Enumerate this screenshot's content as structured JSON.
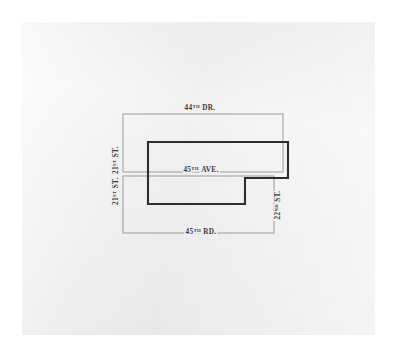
{
  "page": {
    "background_color": "#ffffff",
    "paper_color": "#f0f0f0"
  },
  "map": {
    "title": "Street block and parcel outline diagram",
    "colors": {
      "thin_block_stroke": "#9a9a9a",
      "parcel_outline_stroke": "#2e2e2e",
      "label_text": "#3a3a3a",
      "paper": "#f0f0f0"
    },
    "streets": {
      "top": {
        "name": "44",
        "ordinal": "TH",
        "type": "DR.",
        "full": "44TH DR.",
        "orientation": "horizontal"
      },
      "middle": {
        "name": "45",
        "ordinal": "TH",
        "type": "AVE.",
        "full": "45TH AVE.",
        "orientation": "horizontal"
      },
      "bottom": {
        "name": "45",
        "ordinal": "TH",
        "type": "RD.",
        "full": "45TH RD.",
        "orientation": "horizontal"
      },
      "left_upper": {
        "name": "21",
        "ordinal": "ST",
        "type": "ST.",
        "full": "21ST ST.",
        "orientation": "vertical"
      },
      "left_lower": {
        "name": "21",
        "ordinal": "ST",
        "type": "ST.",
        "full": "21ST ST.",
        "orientation": "vertical"
      },
      "right": {
        "name": "22",
        "ordinal": "ND",
        "type": "ST.",
        "full": "22ND ST.",
        "orientation": "vertical"
      }
    },
    "geometry": {
      "upper_block": {
        "x": 123,
        "y": 114,
        "width": 160,
        "height": 58
      },
      "lower_block": {
        "x": 123,
        "y": 176,
        "width": 151,
        "height": 57
      },
      "parcel_outline_points": "148,142 288,142 288,178 245,178 245,204 148,204"
    }
  }
}
